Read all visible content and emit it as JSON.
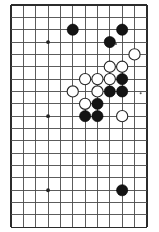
{
  "diagram": {
    "kind": "go-board-diagram",
    "board": {
      "columns": 12,
      "rows": 19,
      "origin_x": 11,
      "origin_y": 5,
      "spacing": 12.35,
      "line_color": "#4a4a4a",
      "edge_color": "#2b2b2b",
      "background_color": "#ffffff",
      "left_edge_is_board_edge": true,
      "right_edge_is_board_edge": true,
      "top_edge_is_board_edge": true,
      "bottom_edge_is_board_edge": true
    },
    "star_points": [
      {
        "col": 3,
        "row": 3
      },
      {
        "col": 3,
        "row": 9
      },
      {
        "col": 3,
        "row": 15
      }
    ],
    "stone_radius": 5.6,
    "stones": [
      {
        "color": "black",
        "col": 5,
        "row": 2
      },
      {
        "color": "black",
        "col": 9,
        "row": 2
      },
      {
        "color": "black",
        "col": 8,
        "row": 3
      },
      {
        "color": "white",
        "col": 10,
        "row": 4
      },
      {
        "color": "white",
        "col": 8,
        "row": 5
      },
      {
        "color": "white",
        "col": 9,
        "row": 5
      },
      {
        "color": "white",
        "col": 6,
        "row": 6
      },
      {
        "color": "white",
        "col": 7,
        "row": 6
      },
      {
        "color": "white",
        "col": 8,
        "row": 6
      },
      {
        "color": "black",
        "col": 9,
        "row": 6
      },
      {
        "color": "white",
        "col": 5,
        "row": 7
      },
      {
        "color": "white",
        "col": 7,
        "row": 7
      },
      {
        "color": "black",
        "col": 8,
        "row": 7
      },
      {
        "color": "black",
        "col": 9,
        "row": 7
      },
      {
        "color": "white",
        "col": 6,
        "row": 8
      },
      {
        "color": "black",
        "col": 7,
        "row": 8
      },
      {
        "color": "black",
        "col": 6,
        "row": 9
      },
      {
        "color": "black",
        "col": 7,
        "row": 9
      },
      {
        "color": "white",
        "col": 9,
        "row": 9
      },
      {
        "color": "black",
        "col": 9,
        "row": 15
      }
    ],
    "marks": [
      {
        "type": "dot",
        "col": 8,
        "row": 3
      },
      {
        "type": "dot",
        "col": 10,
        "row": 7
      }
    ],
    "counts": {
      "black_stones": 10,
      "white_stones": 10,
      "total_stones": 20
    },
    "colors": {
      "black_stone": "#141414",
      "white_stone": "#ffffff",
      "white_stone_outline": "#262626",
      "grid": "#4a4a4a",
      "hoshi": "#222222"
    }
  }
}
